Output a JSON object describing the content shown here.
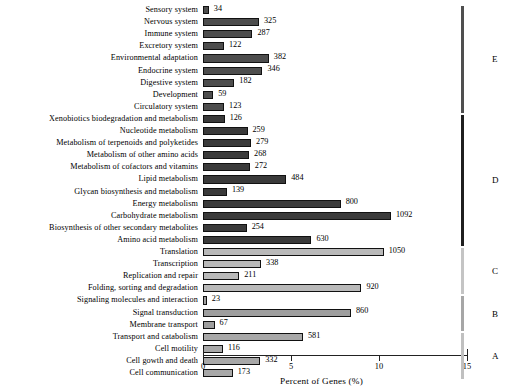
{
  "chart_data": {
    "type": "bar",
    "orientation": "horizontal",
    "title": "",
    "xlabel": "Percent of Genes (%)",
    "ylabel": "",
    "xlim": [
      0,
      15
    ],
    "xticks": [
      "0",
      "5",
      "10",
      "15"
    ],
    "grid": false,
    "legend_position": "right-brackets",
    "value_unit": "gene count",
    "categories": [
      "Sensory system",
      "Nervous system",
      "Immune system",
      "Excretory system",
      "Environmental adaptation",
      "Endocrine system",
      "Digestive system",
      "Development",
      "Circulatory system",
      "Xenobiotics biodegradation and metabolism",
      "Nucleotide metabolism",
      "Metabolism of terpenoids and polyketides",
      "Metabolism of other amino acids",
      "Metabolism of cofactors and vitamins",
      "Lipid metabolism",
      "Glycan biosynthesis and metabolism",
      "Energy metabolism",
      "Carbohydrate metabolism",
      "Biosynthesis of other secondary metabolites",
      "Amino acid metabolism",
      "Translation",
      "Transcription",
      "Replication and repair",
      "Folding, sorting and degradation",
      "Signaling molecules and interaction",
      "Signal transduction",
      "Membrane transport",
      "Transport and catabolism",
      "Cell motility",
      "Cell gowth and death",
      "Cell communication"
    ],
    "values": [
      34,
      325,
      287,
      122,
      382,
      346,
      182,
      59,
      123,
      126,
      259,
      279,
      268,
      272,
      484,
      139,
      800,
      1092,
      254,
      630,
      1050,
      338,
      211,
      920,
      23,
      860,
      67,
      581,
      116,
      332,
      173
    ],
    "percents": [
      0.33,
      3.18,
      2.81,
      1.19,
      3.74,
      3.38,
      1.78,
      0.58,
      1.2,
      1.23,
      2.53,
      2.73,
      2.62,
      2.66,
      4.73,
      1.36,
      7.82,
      10.68,
      2.48,
      6.16,
      10.27,
      3.3,
      2.06,
      9.0,
      0.22,
      8.41,
      0.66,
      5.68,
      1.13,
      3.25,
      1.69
    ],
    "groups": [
      "E",
      "E",
      "E",
      "E",
      "E",
      "E",
      "E",
      "E",
      "E",
      "D",
      "D",
      "D",
      "D",
      "D",
      "D",
      "D",
      "D",
      "D",
      "D",
      "D",
      "C",
      "C",
      "C",
      "C",
      "B",
      "B",
      "B",
      "A",
      "A",
      "A",
      "A"
    ],
    "group_labels": [
      "E",
      "D",
      "C",
      "B",
      "A"
    ],
    "group_colors": {
      "E": "#4d4d4d",
      "D": "#3a3a3a",
      "C": "#b9b9b9",
      "B": "#9e9e9e",
      "A": "#a8a8a8"
    }
  }
}
